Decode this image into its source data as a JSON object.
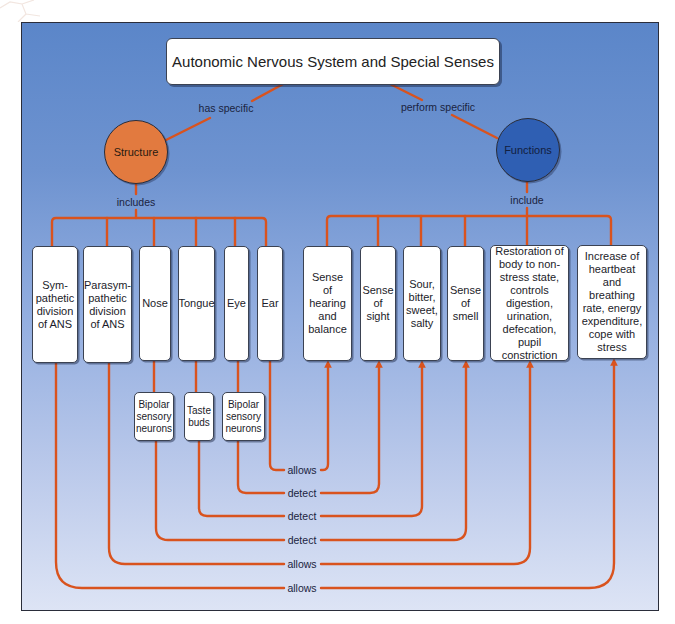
{
  "title": "Autonomic Nervous System and Special Senses",
  "links": {
    "has_specific": "has specific",
    "perform_specific": "perform specific",
    "includes": "includes",
    "include": "include"
  },
  "nodes": {
    "structure": "Structure",
    "functions": "Functions"
  },
  "structures": [
    {
      "id": "sympathetic",
      "label": "Sym-pathetic division of ANS"
    },
    {
      "id": "parasympathetic",
      "label": "Parasym-pathetic division of ANS"
    },
    {
      "id": "nose",
      "label": "Nose"
    },
    {
      "id": "tongue",
      "label": "Tongue"
    },
    {
      "id": "eye",
      "label": "Eye"
    },
    {
      "id": "ear",
      "label": "Ear"
    }
  ],
  "receptors": [
    {
      "id": "nose-receptor",
      "label": "Bipolar sensory neurons"
    },
    {
      "id": "tongue-receptor",
      "label": "Taste buds"
    },
    {
      "id": "eye-receptor",
      "label": "Bipolar sensory neurons"
    }
  ],
  "functions": [
    {
      "id": "hearing",
      "label": "Sense of hearing and balance"
    },
    {
      "id": "sight",
      "label": "Sense of sight"
    },
    {
      "id": "taste",
      "label": "Sour, bitter, sweet, salty"
    },
    {
      "id": "smell",
      "label": "Sense of smell"
    },
    {
      "id": "restoration",
      "label": "Restoration of body to non-stress state, controls digestion, urination, defecation, pupil constriction"
    },
    {
      "id": "increase",
      "label": "Increase of heartbeat and breathing rate, energy expenditure, cope with stress"
    }
  ],
  "connections": [
    {
      "from": "Ear",
      "label": "allows",
      "to": "Sense of hearing and balance"
    },
    {
      "from": "Eye (Bipolar sensory neurons)",
      "label": "detect",
      "to": "Sense of sight"
    },
    {
      "from": "Tongue (Taste buds)",
      "label": "detect",
      "to": "Sour, bitter, sweet, salty"
    },
    {
      "from": "Nose (Bipolar sensory neurons)",
      "label": "detect",
      "to": "Sense of smell"
    },
    {
      "from": "Parasympathetic division of ANS",
      "label": "allows",
      "to": "Restoration of body to non-stress state"
    },
    {
      "from": "Sympathetic division of ANS",
      "label": "allows",
      "to": "Increase of heartbeat and breathing rate"
    }
  ],
  "colors": {
    "line": "#d9531e",
    "structure": "#e27a3f",
    "functions": "#2f5fb3",
    "background_top": "#5b86c9",
    "background_bottom": "#dde4f5"
  }
}
